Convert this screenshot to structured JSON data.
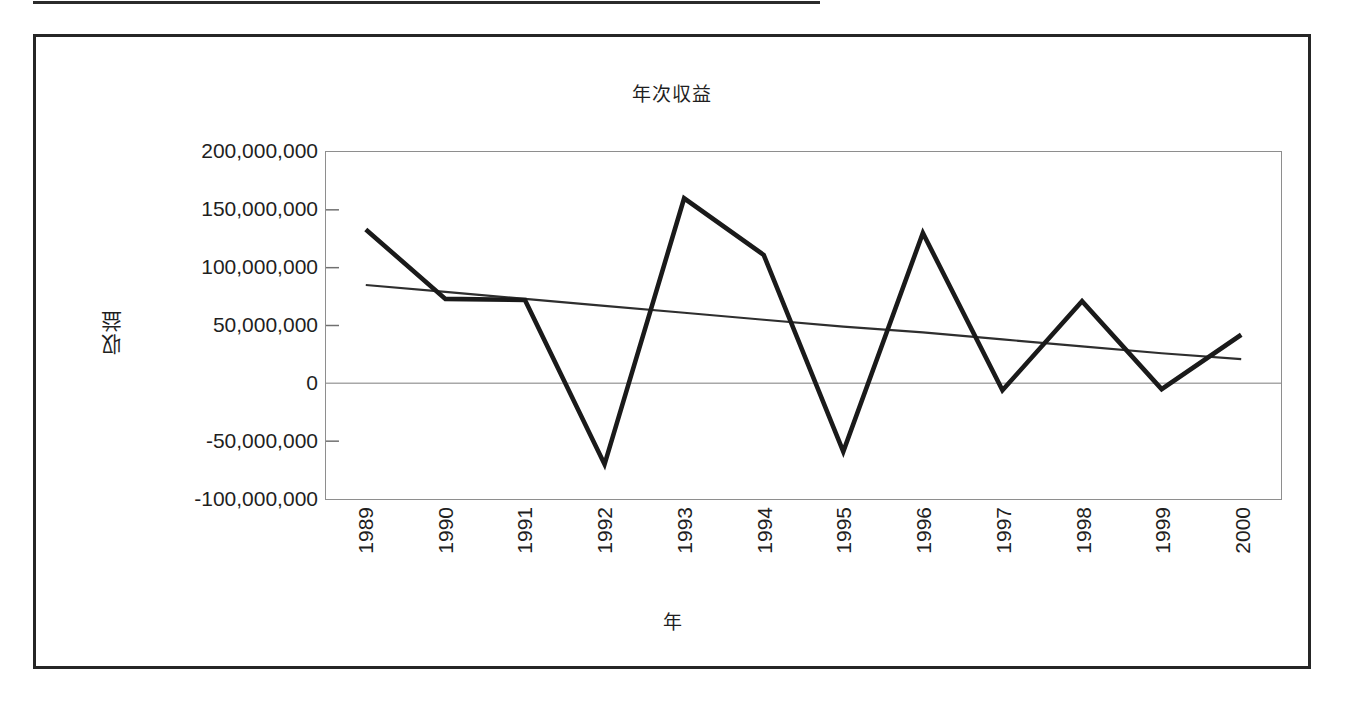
{
  "chart_data": {
    "type": "line",
    "title": "年次収益",
    "xlabel": "年",
    "ylabel": "収益",
    "categories": [
      "1989",
      "1990",
      "1991",
      "1992",
      "1993",
      "1994",
      "1995",
      "1996",
      "1997",
      "1998",
      "1999",
      "2000"
    ],
    "series": [
      {
        "name": "収益",
        "values": [
          133000000,
          73000000,
          72000000,
          -70000000,
          160000000,
          111000000,
          -59000000,
          130000000,
          -6000000,
          71000000,
          -5000000,
          42000000
        ]
      },
      {
        "name": "trendline",
        "values": [
          85000000,
          79000000,
          73000000,
          67000000,
          61000000,
          55000000,
          49000000,
          44000000,
          38000000,
          32000000,
          26000000,
          21000000
        ]
      }
    ],
    "ylim": [
      -100000000,
      200000000
    ],
    "ytick_labels": [
      "200,000,000",
      "150,000,000",
      "100,000,000",
      "50,000,000",
      "0",
      "-50,000,000",
      "-100,000,000"
    ],
    "ytick_values": [
      200000000,
      150000000,
      100000000,
      50000000,
      0,
      -50000000,
      -100000000
    ],
    "grid": false,
    "zero_line": true,
    "legend": "none"
  },
  "colors": {
    "series_line": "#1a1a1a",
    "trend_line": "#2e2e2e",
    "plot_border": "#8e8e8e",
    "frame_border": "#262626",
    "zero_line": "#a8a8a8",
    "background": "#ffffff"
  }
}
